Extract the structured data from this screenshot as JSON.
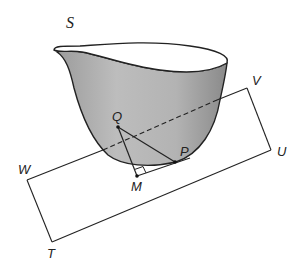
{
  "figure": {
    "surface_label": "S",
    "plane_vertices": {
      "W": "W",
      "V": "V",
      "U": "U",
      "T": "T"
    },
    "points": {
      "Q": "Q",
      "P": "P",
      "M": "M"
    },
    "colors": {
      "bowl_fill": "#b8b8b8",
      "bowl_shade_dark": "#8e8e8e",
      "stroke": "#222222",
      "background": "#ffffff"
    }
  }
}
